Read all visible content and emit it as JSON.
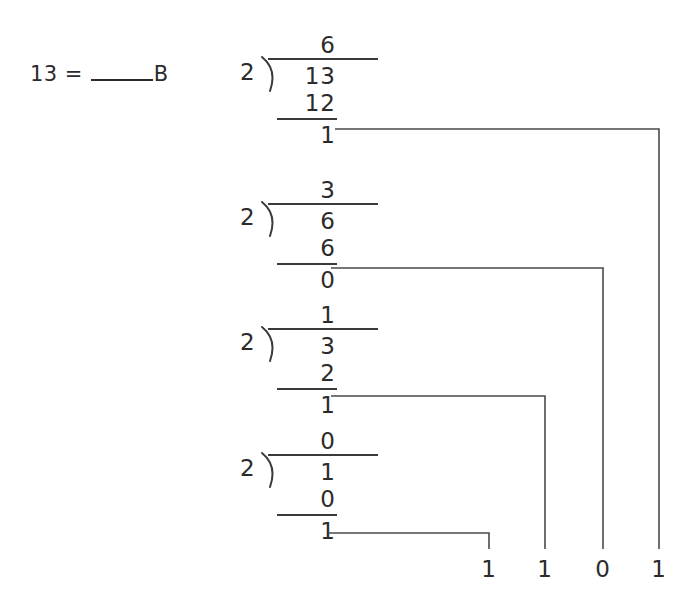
{
  "problem": {
    "value": "13",
    "equals": "=",
    "blank_answer": "",
    "base_label": "B"
  },
  "divisions": [
    {
      "divisor": "2",
      "dividend": "13",
      "quotient": "6",
      "product": "12",
      "remainder": "1"
    },
    {
      "divisor": "2",
      "dividend": "6",
      "quotient": "3",
      "product": "6",
      "remainder": "0"
    },
    {
      "divisor": "2",
      "dividend": "3",
      "quotient": "1",
      "product": "2",
      "remainder": "1"
    },
    {
      "divisor": "2",
      "dividend": "1",
      "quotient": "0",
      "product": "0",
      "remainder": "1"
    }
  ],
  "result_digits": [
    "1",
    "1",
    "0",
    "1"
  ],
  "colors": {
    "ink": "#2b2b2b",
    "rule": "#3a3a3a",
    "background": "#ffffff"
  }
}
